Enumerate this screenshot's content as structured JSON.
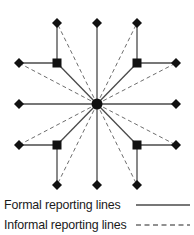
{
  "figure": {
    "type": "hub-and-spoke network diagram",
    "background_color": "#ffffff",
    "line_color": "#4a4a4a",
    "node_color": "#111111",
    "width": 194,
    "height": 235
  },
  "chart_data": {
    "type": "diagram",
    "title": "",
    "nodes": [
      {
        "id": "center",
        "shape": "circle",
        "x": 97,
        "y": 104,
        "size": 11
      },
      {
        "id": "sq-top-left",
        "shape": "square",
        "x": 57,
        "y": 63,
        "size": 9
      },
      {
        "id": "sq-top-right",
        "shape": "square",
        "x": 137,
        "y": 63,
        "size": 9
      },
      {
        "id": "sq-bottom-left",
        "shape": "square",
        "x": 57,
        "y": 145,
        "size": 9
      },
      {
        "id": "sq-bottom-right",
        "shape": "square",
        "x": 137,
        "y": 145,
        "size": 9
      },
      {
        "id": "d-top-left",
        "shape": "diamond",
        "x": 57,
        "y": 23,
        "size": 10
      },
      {
        "id": "d-top-center",
        "shape": "diamond",
        "x": 97,
        "y": 23,
        "size": 10
      },
      {
        "id": "d-top-right",
        "shape": "diamond",
        "x": 137,
        "y": 23,
        "size": 10
      },
      {
        "id": "d-left-upper",
        "shape": "diamond",
        "x": 19,
        "y": 63,
        "size": 10
      },
      {
        "id": "d-right-upper",
        "shape": "diamond",
        "x": 176,
        "y": 63,
        "size": 10
      },
      {
        "id": "d-left-center",
        "shape": "diamond",
        "x": 19,
        "y": 104,
        "size": 10
      },
      {
        "id": "d-right-center",
        "shape": "diamond",
        "x": 176,
        "y": 104,
        "size": 10
      },
      {
        "id": "d-left-lower",
        "shape": "diamond",
        "x": 19,
        "y": 145,
        "size": 10
      },
      {
        "id": "d-right-lower",
        "shape": "diamond",
        "x": 176,
        "y": 145,
        "size": 10
      },
      {
        "id": "d-bottom-left",
        "shape": "diamond",
        "x": 57,
        "y": 185,
        "size": 10
      },
      {
        "id": "d-bottom-center",
        "shape": "diamond",
        "x": 97,
        "y": 185,
        "size": 10
      },
      {
        "id": "d-bottom-right",
        "shape": "diamond",
        "x": 137,
        "y": 185,
        "size": 10
      }
    ],
    "formal_edges": [
      {
        "from": "center",
        "to": "d-top-center"
      },
      {
        "from": "center",
        "to": "d-bottom-center"
      },
      {
        "from": "center",
        "to": "d-left-center"
      },
      {
        "from": "center",
        "to": "d-right-center"
      },
      {
        "from": "center",
        "to": "sq-top-left"
      },
      {
        "from": "center",
        "to": "sq-top-right"
      },
      {
        "from": "center",
        "to": "sq-bottom-left"
      },
      {
        "from": "center",
        "to": "sq-bottom-right"
      },
      {
        "from": "sq-top-left",
        "to": "d-top-left"
      },
      {
        "from": "sq-top-left",
        "to": "d-left-upper"
      },
      {
        "from": "sq-top-right",
        "to": "d-top-right"
      },
      {
        "from": "sq-top-right",
        "to": "d-right-upper"
      },
      {
        "from": "sq-bottom-left",
        "to": "d-bottom-left"
      },
      {
        "from": "sq-bottom-left",
        "to": "d-left-lower"
      },
      {
        "from": "sq-bottom-right",
        "to": "d-bottom-right"
      },
      {
        "from": "sq-bottom-right",
        "to": "d-right-lower"
      }
    ],
    "informal_edges": [
      {
        "from": "center",
        "to": "d-top-left"
      },
      {
        "from": "center",
        "to": "d-top-right"
      },
      {
        "from": "center",
        "to": "d-left-upper"
      },
      {
        "from": "center",
        "to": "d-right-upper"
      },
      {
        "from": "center",
        "to": "d-left-lower"
      },
      {
        "from": "center",
        "to": "d-right-lower"
      },
      {
        "from": "center",
        "to": "d-bottom-left"
      },
      {
        "from": "center",
        "to": "d-bottom-right"
      }
    ]
  },
  "legend": {
    "formal": {
      "label": "Formal reporting lines",
      "style": "solid"
    },
    "informal": {
      "label": "Informal reporting lines",
      "style": "dashed"
    }
  }
}
